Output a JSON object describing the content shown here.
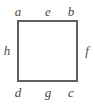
{
  "figure": {
    "kind": "labeled-square-diagram",
    "stroke_color": "#5f5f5f",
    "label_color": "#4a4a4a",
    "background_color": "#ffffff",
    "stroke_width": 1.6,
    "square": {
      "left": 17,
      "top": 20,
      "right": 78,
      "bottom": 82,
      "width": 61,
      "height": 62
    },
    "corner_labels": {
      "top_left": "a",
      "top_right": "b",
      "bottom_right": "c",
      "bottom_left": "d"
    },
    "edge_labels": {
      "top": "e",
      "right": "f",
      "bottom": "g",
      "left": "h"
    }
  }
}
